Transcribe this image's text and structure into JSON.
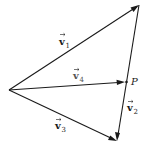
{
  "diagram": {
    "type": "vector-triangle",
    "points": {
      "origin": {
        "x": 9,
        "y": 90
      },
      "top_vertex": {
        "x": 139,
        "y": 5
      },
      "bottom_vertex": {
        "x": 117,
        "y": 141
      },
      "P": {
        "x": 126,
        "y": 82,
        "label": "P"
      }
    },
    "vectors": [
      {
        "id": "v1",
        "name": "v",
        "subscript": "1",
        "from": "origin",
        "to": "top_vertex"
      },
      {
        "id": "v2",
        "name": "v",
        "subscript": "2",
        "from": "top_vertex",
        "to": "bottom_vertex"
      },
      {
        "id": "v3",
        "name": "v",
        "subscript": "3",
        "from": "origin",
        "to": "bottom_vertex"
      },
      {
        "id": "v4",
        "name": "v",
        "subscript": "4",
        "from": "origin",
        "to": "P"
      }
    ],
    "labels": {
      "v1": {
        "name": "v",
        "sub": "1"
      },
      "v2": {
        "name": "v",
        "sub": "2"
      },
      "v3": {
        "name": "v",
        "sub": "3"
      },
      "v4": {
        "name": "v",
        "sub": "4"
      },
      "P": "P"
    },
    "colors": {
      "stroke": "#1a1a1a",
      "background": "#ffffff"
    }
  }
}
